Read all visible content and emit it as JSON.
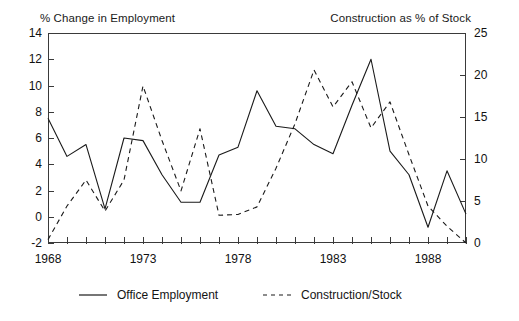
{
  "chart_data": {
    "type": "line",
    "title": "",
    "xlabel": "",
    "left_axis": {
      "label": "% Change in Employment",
      "ylim": [
        -2,
        14
      ],
      "ticks": [
        -2,
        0,
        2,
        4,
        6,
        8,
        10,
        12,
        14
      ]
    },
    "right_axis": {
      "label": "Construction as % of Stock",
      "ylim": [
        0,
        25
      ],
      "ticks": [
        0,
        5,
        10,
        15,
        20,
        25
      ]
    },
    "x": [
      1968,
      1969,
      1970,
      1971,
      1972,
      1973,
      1974,
      1975,
      1976,
      1977,
      1978,
      1979,
      1980,
      1981,
      1982,
      1983,
      1984,
      1985,
      1986,
      1987,
      1988,
      1989,
      1990
    ],
    "xticks_labeled": [
      1968,
      1973,
      1978,
      1983,
      1988
    ],
    "xtick_count": 23,
    "grid": false,
    "legend_position": "bottom",
    "series": [
      {
        "name": "Office Employment",
        "axis": "left",
        "style": "solid",
        "color": "#1a1a1a",
        "values": [
          7.5,
          4.6,
          5.5,
          0.6,
          6.0,
          5.8,
          3.2,
          1.1,
          1.1,
          4.7,
          5.3,
          9.6,
          6.9,
          6.7,
          5.5,
          4.8,
          8.5,
          12.0,
          5.0,
          3.2,
          -0.8,
          3.5,
          0.2
        ]
      },
      {
        "name": "Construction/Stock",
        "axis": "right",
        "style": "dashed",
        "color": "#1a1a1a",
        "values": [
          0.4,
          4.4,
          7.5,
          3.8,
          7.5,
          18.7,
          12.2,
          6.2,
          13.6,
          3.3,
          3.4,
          4.3,
          8.9,
          14.2,
          20.6,
          16.2,
          19.2,
          13.7,
          16.8,
          10.5,
          4.4,
          2.0,
          0.0
        ]
      }
    ]
  },
  "legend": {
    "items": [
      {
        "label": "Office Employment",
        "style": "solid"
      },
      {
        "label": "Construction/Stock",
        "style": "dashed"
      }
    ]
  }
}
